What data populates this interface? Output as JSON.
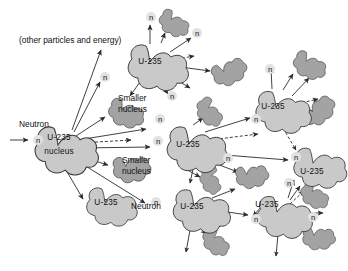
{
  "figure": {
    "colors": {
      "uranium_nucleus_fill": "#c9c9c9",
      "fission_fragment_fill": "#a3a3a3",
      "outline": "#3a3a3a",
      "arrow": "#2b2b2b",
      "background": "#ffffff",
      "text": "#111111"
    },
    "annotations": {
      "other_particles": "(other particles and energy)",
      "neutron_left": "Neutron",
      "neutron_mid": "Neutron",
      "smaller_nucleus_upper": "Smaller\nnucleus",
      "smaller_nucleus_lower": "Smaller\nnucleus"
    },
    "text": {
      "other_particles_and_energy": "(other particles and energy)",
      "neutron": "Neutron",
      "smaller_line1": "Smaller",
      "smaller_line2": "nucleus",
      "u235": "U-235",
      "nucleus": "nucleus",
      "n": "n"
    },
    "nuclei": [
      {
        "id": "u-main",
        "label_line1": "U-235",
        "label_line2": "nucleus",
        "x": 58,
        "y": 146,
        "r": 26,
        "kind": "uranium"
      },
      {
        "id": "u-top",
        "label_line1": "U-235",
        "label_line2": "",
        "x": 150,
        "y": 63,
        "r": 25,
        "kind": "uranium"
      },
      {
        "id": "u-bottomleft",
        "label_line1": "U-235",
        "label_line2": "",
        "x": 105,
        "y": 203,
        "r": 21,
        "kind": "uranium"
      },
      {
        "id": "u-center",
        "label_line1": "U-235",
        "label_line2": "",
        "x": 189,
        "y": 145,
        "r": 25,
        "kind": "uranium"
      },
      {
        "id": "u-lowercenter",
        "label_line1": "U-235",
        "label_line2": "",
        "x": 194,
        "y": 207,
        "r": 24,
        "kind": "uranium"
      },
      {
        "id": "u-upperright",
        "label_line1": "U-235",
        "label_line2": "",
        "x": 276,
        "y": 108,
        "r": 23,
        "kind": "uranium"
      },
      {
        "id": "u-right",
        "label_line1": "U-235",
        "label_line2": "",
        "x": 311,
        "y": 164,
        "r": 22,
        "kind": "uranium"
      },
      {
        "id": "u-lowerright",
        "label_line1": "U-235",
        "label_line2": "",
        "x": 277,
        "y": 213,
        "r": 23,
        "kind": "uranium"
      }
    ],
    "fragments": [
      {
        "id": "frag-top",
        "x": 171,
        "y": 20,
        "r": 13,
        "labelled": false
      },
      {
        "id": "frag-topright",
        "x": 224,
        "y": 72,
        "r": 14,
        "labelled": false
      },
      {
        "id": "frag-smaller-upper",
        "x": 122,
        "y": 110,
        "r": 15,
        "labelled": true,
        "label": "Smaller nucleus"
      },
      {
        "id": "frag-smaller-lower",
        "x": 126,
        "y": 167,
        "r": 15,
        "labelled": true,
        "label": "Smaller nucleus"
      },
      {
        "id": "frag-midtop",
        "x": 208,
        "y": 108,
        "r": 12,
        "labelled": false
      },
      {
        "id": "frag-midright",
        "x": 247,
        "y": 175,
        "r": 13,
        "labelled": false
      },
      {
        "id": "frag-mid2",
        "x": 211,
        "y": 176,
        "r": 11,
        "labelled": false
      },
      {
        "id": "frag-ur1",
        "x": 305,
        "y": 62,
        "r": 14,
        "labelled": false
      },
      {
        "id": "frag-ur2",
        "x": 312,
        "y": 112,
        "r": 14,
        "labelled": false
      },
      {
        "id": "frag-lr1",
        "x": 311,
        "y": 192,
        "r": 12,
        "labelled": false
      },
      {
        "id": "frag-lr2",
        "x": 313,
        "y": 235,
        "r": 13,
        "labelled": false
      },
      {
        "id": "frag-bottom",
        "x": 214,
        "y": 238,
        "r": 12,
        "labelled": false
      }
    ],
    "neutron_labels": [
      {
        "x": 38,
        "y": 140
      },
      {
        "x": 106,
        "y": 76
      },
      {
        "x": 152,
        "y": 18
      },
      {
        "x": 198,
        "y": 33
      },
      {
        "x": 172,
        "y": 96
      },
      {
        "x": 162,
        "y": 119
      },
      {
        "x": 158,
        "y": 141
      },
      {
        "x": 228,
        "y": 158
      },
      {
        "x": 256,
        "y": 119
      },
      {
        "x": 268,
        "y": 72
      },
      {
        "x": 296,
        "y": 157
      },
      {
        "x": 288,
        "y": 185
      },
      {
        "x": 256,
        "y": 219
      },
      {
        "x": 312,
        "y": 217
      },
      {
        "x": 156,
        "y": 202
      }
    ],
    "caption": ""
  }
}
